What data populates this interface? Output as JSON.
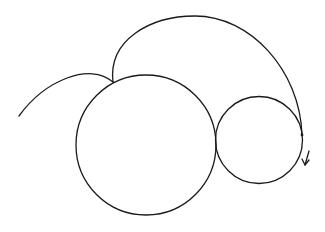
{
  "diagram": {
    "type": "epicycloid-trajectory",
    "stroke_color": "#1a1a1a",
    "background": "#ffffff",
    "large_circle": {
      "cx": 146,
      "cy": 145,
      "r": 70
    },
    "small_circle": {
      "cx": 259,
      "cy": 140,
      "r": 43.5
    },
    "tangent_point": {
      "x": 215,
      "y": 140
    },
    "cusp_point": {
      "x": 113,
      "y": 82
    },
    "tracing_point": {
      "x": 302,
      "y": 135
    },
    "left_arc": {
      "path": "M 19 116 C 45 80, 90 62, 113 82"
    },
    "top_arc": {
      "path": "M 113 82 C 108 40, 150 16, 195 16 C 250 16, 300 70, 302 135"
    },
    "direction_arrow": {
      "shaft": "M 309 151 L 305 165",
      "head": "M 302 159 L 305 165 L 309 160"
    }
  }
}
